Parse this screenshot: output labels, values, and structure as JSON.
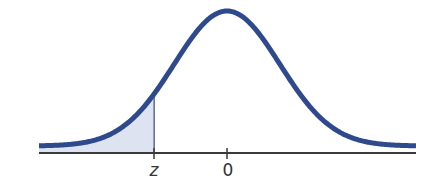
{
  "chart_data": {
    "type": "area",
    "title": "",
    "distribution": "standard normal",
    "mean": 0,
    "shaded_region": {
      "from": "-inf",
      "to": "z",
      "approx_z": -1.38
    },
    "xlabel": "",
    "ylabel": "",
    "tick_labels": [
      "z",
      "0"
    ],
    "ticks": [
      {
        "label": "z",
        "value": -1.38
      },
      {
        "label": "0",
        "value": 0
      }
    ],
    "xlim": [
      -3.6,
      3.6
    ],
    "grid": false,
    "legend": null
  },
  "labels": {
    "z": "z",
    "zero": "0"
  },
  "colors": {
    "curve": "#2e4a8c",
    "shade": "#dde3f1",
    "axis": "#3a3a3a",
    "z_line": "#3c4a6e"
  }
}
